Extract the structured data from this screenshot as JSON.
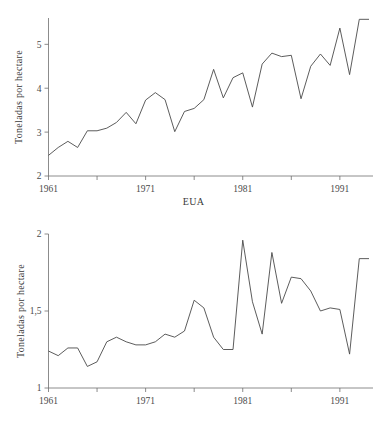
{
  "figure": {
    "background_color": "#ffffff",
    "line_color": "#4a4a4a",
    "axis_color": "#6f6f6f"
  },
  "panels": [
    {
      "id": "eua",
      "caption": "EUA",
      "ylabel": "Toneladas por hectare",
      "y_ticks": [
        "2",
        "3",
        "4",
        "5"
      ],
      "x_ticks": [
        "1961",
        "1971",
        "1981",
        "1991"
      ]
    },
    {
      "id": "quenia",
      "caption": "Quênia",
      "ylabel": "Toneladas por hectare",
      "y_ticks": [
        "1",
        "1,5",
        "2"
      ],
      "x_ticks": [
        "1961",
        "1971",
        "1981",
        "1991"
      ]
    }
  ],
  "chart_data": [
    {
      "type": "line",
      "title": "EUA",
      "xlabel": "EUA",
      "ylabel": "Toneladas por hectare",
      "xlim": [
        1961,
        1994
      ],
      "ylim": [
        2,
        5.6
      ],
      "y_ticks": [
        2,
        3,
        4,
        5
      ],
      "y_tick_labels": [
        "2",
        "3",
        "4",
        "5"
      ],
      "x_ticks": [
        1961,
        1966,
        1971,
        1976,
        1981,
        1986,
        1991
      ],
      "x_tick_labels": [
        "1961",
        "",
        "1971",
        "",
        "1981",
        "",
        "1991"
      ],
      "grid": false,
      "legend": "none",
      "x": [
        1961,
        1962,
        1963,
        1964,
        1965,
        1966,
        1967,
        1968,
        1969,
        1970,
        1971,
        1972,
        1973,
        1974,
        1975,
        1976,
        1977,
        1978,
        1979,
        1980,
        1981,
        1982,
        1983,
        1984,
        1985,
        1986,
        1987,
        1988,
        1989,
        1990,
        1991,
        1992,
        1993,
        1994
      ],
      "values": [
        2.47,
        2.65,
        2.79,
        2.65,
        3.03,
        3.03,
        3.09,
        3.22,
        3.45,
        3.19,
        3.73,
        3.9,
        3.74,
        3.01,
        3.47,
        3.54,
        3.74,
        4.43,
        3.78,
        4.24,
        4.35,
        3.57,
        4.55,
        4.8,
        4.72,
        4.75,
        3.76,
        4.5,
        4.78,
        4.52,
        5.37,
        4.31,
        5.57,
        5.57
      ]
    },
    {
      "type": "line",
      "title": "Quênia",
      "xlabel": "Quênia",
      "ylabel": "Toneladas por hectare",
      "xlim": [
        1961,
        1994
      ],
      "ylim": [
        1,
        2
      ],
      "y_ticks": [
        1,
        1.5,
        2
      ],
      "y_tick_labels": [
        "1",
        "1,5",
        "2"
      ],
      "x_ticks": [
        1961,
        1966,
        1971,
        1976,
        1981,
        1986,
        1991
      ],
      "x_tick_labels": [
        "1961",
        "",
        "1971",
        "",
        "1981",
        "",
        "1991"
      ],
      "grid": false,
      "legend": "none",
      "x": [
        1961,
        1962,
        1963,
        1964,
        1965,
        1966,
        1967,
        1968,
        1969,
        1970,
        1971,
        1972,
        1973,
        1974,
        1975,
        1976,
        1977,
        1978,
        1979,
        1980,
        1981,
        1982,
        1983,
        1984,
        1985,
        1986,
        1987,
        1988,
        1989,
        1990,
        1991,
        1992,
        1993,
        1994
      ],
      "values": [
        1.24,
        1.21,
        1.26,
        1.26,
        1.14,
        1.17,
        1.3,
        1.33,
        1.3,
        1.28,
        1.28,
        1.3,
        1.35,
        1.33,
        1.37,
        1.57,
        1.52,
        1.33,
        1.25,
        1.25,
        1.96,
        1.56,
        1.35,
        1.88,
        1.55,
        1.72,
        1.71,
        1.63,
        1.5,
        1.52,
        1.51,
        1.22,
        1.84,
        1.84
      ]
    }
  ]
}
